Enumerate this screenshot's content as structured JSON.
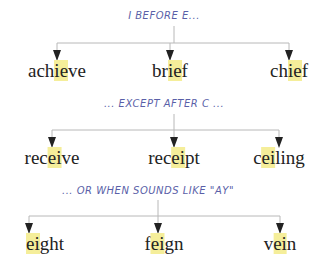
{
  "groups": [
    {
      "title": "I BEFORE E...",
      "words": [
        {
          "pre": "ach",
          "hl": "ie",
          "post": "ve"
        },
        {
          "pre": "br",
          "hl": "ie",
          "post": "f"
        },
        {
          "pre": "ch",
          "hl": "ie",
          "post": "f"
        }
      ]
    },
    {
      "title": "... EXCEPT AFTER C ...",
      "words": [
        {
          "pre": "rec",
          "hl": "ei",
          "post": "ve"
        },
        {
          "pre": "rec",
          "hl": "ei",
          "post": "pt"
        },
        {
          "pre": "c",
          "hl": "ei",
          "post": "ling"
        }
      ]
    },
    {
      "title": "... OR WHEN SOUNDS LIKE \"AY\"",
      "words": [
        {
          "pre": "",
          "hl": "ei",
          "post": "ght"
        },
        {
          "pre": "f",
          "hl": "ei",
          "post": "gn"
        },
        {
          "pre": "v",
          "hl": "ei",
          "post": "n"
        }
      ]
    }
  ],
  "colors": {
    "title": "#5a5fa8",
    "highlight": "#f5ee9a",
    "line": "#b0b0b0",
    "arrow": "#222222"
  }
}
